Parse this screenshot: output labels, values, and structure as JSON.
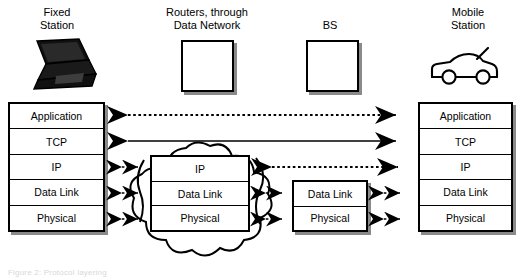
{
  "figure": {
    "kind": "protocol-stack-diagram",
    "footer_note": "Figure 2: Protocol layering"
  },
  "nodes": {
    "fixed_station": {
      "label": "Fixed\nStation",
      "icon": "laptop-icon"
    },
    "routers": {
      "label": "Routers, through\nData Network",
      "icon": "square-box-icon"
    },
    "base_station": {
      "label": "BS",
      "icon": "square-box-icon"
    },
    "mobile_station": {
      "label": "Mobile\nStation",
      "icon": "car-icon"
    }
  },
  "stacks": {
    "fixed": {
      "name": "Fixed Station stack",
      "layers": [
        "Application",
        "TCP",
        "IP",
        "Data Link",
        "Physical"
      ]
    },
    "router": {
      "name": "Router stack",
      "layers": [
        "IP",
        "Data Link",
        "Physical"
      ]
    },
    "bs": {
      "name": "Base Station stack",
      "layers": [
        "Data Link",
        "Physical"
      ]
    },
    "mobile": {
      "name": "Mobile Station stack",
      "layers": [
        "Application",
        "TCP",
        "IP",
        "Data Link",
        "Physical"
      ]
    }
  },
  "links": [
    {
      "layer": "Application",
      "from": "fixed",
      "to": "mobile",
      "style": "dotted",
      "arrows": "both"
    },
    {
      "layer": "TCP",
      "from": "fixed",
      "to": "mobile",
      "style": "solid",
      "arrows": "both"
    },
    {
      "layer": "IP",
      "from": "fixed",
      "to": "router",
      "style": "dotted",
      "arrows": "both"
    },
    {
      "layer": "IP",
      "from": "router",
      "to": "mobile",
      "style": "dotted",
      "arrows": "both"
    },
    {
      "layer": "Data Link",
      "from": "fixed",
      "to": "router",
      "style": "dotted",
      "arrows": "both"
    },
    {
      "layer": "Data Link",
      "from": "router",
      "to": "bs",
      "style": "dotted",
      "arrows": "both"
    },
    {
      "layer": "Data Link",
      "from": "bs",
      "to": "mobile",
      "style": "dotted",
      "arrows": "both"
    },
    {
      "layer": "Physical",
      "from": "fixed",
      "to": "router",
      "style": "dotted",
      "arrows": "both"
    },
    {
      "layer": "Physical",
      "from": "router",
      "to": "bs",
      "style": "dotted",
      "arrows": "both"
    },
    {
      "layer": "Physical",
      "from": "bs",
      "to": "mobile",
      "style": "dotted",
      "arrows": "both"
    }
  ],
  "colors": {
    "line": "#000000",
    "shadow": "#8a8a8a",
    "background": "#ffffff"
  }
}
